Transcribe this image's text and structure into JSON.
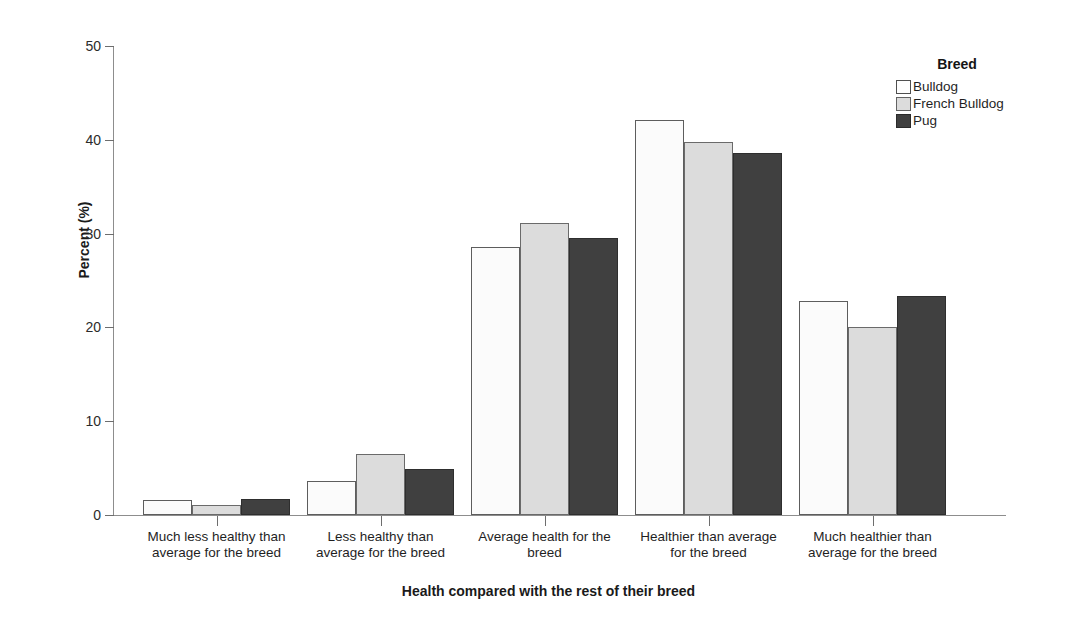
{
  "chart_data": {
    "type": "bar",
    "title": "",
    "xlabel": "Health compared with the rest of their breed",
    "ylabel": "Percent (%)",
    "ylim": [
      0,
      50
    ],
    "yticks": [
      0,
      10,
      20,
      30,
      40,
      50
    ],
    "grid": false,
    "legend_title": "Breed",
    "legend_position": "top-right",
    "categories": [
      "Much less healthy than\naverage for the breed",
      "Less healthy than\naverage for the breed",
      "Average health for the\nbreed",
      "Healthier than average\nfor the breed",
      "Much healthier than\naverage for the breed"
    ],
    "series": [
      {
        "name": "Bulldog",
        "color": "#fbfbfb",
        "values": [
          1.6,
          3.6,
          28.6,
          42.1,
          22.8
        ]
      },
      {
        "name": "French Bulldog",
        "color": "#dcdcdc",
        "values": [
          1.1,
          6.5,
          31.1,
          39.8,
          20.0
        ]
      },
      {
        "name": "Pug",
        "color": "#404040",
        "values": [
          1.7,
          4.9,
          29.5,
          38.6,
          23.4
        ]
      }
    ]
  },
  "axis": {
    "y_title": "Percent (%)",
    "x_title": "Health compared with the rest of their breed",
    "y_tick_labels": [
      "50",
      "40",
      "30",
      "20",
      "10",
      "0"
    ]
  },
  "legend": {
    "title": "Breed",
    "items": [
      {
        "label": "Bulldog"
      },
      {
        "label": "French Bulldog"
      },
      {
        "label": "Pug"
      }
    ]
  }
}
